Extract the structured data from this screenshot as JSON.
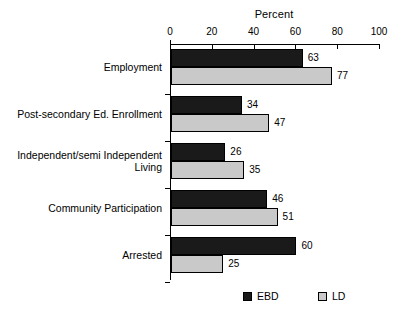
{
  "chart_data": {
    "type": "bar",
    "orientation": "horizontal",
    "title": "Percent",
    "xlabel": "Percent",
    "ylabel": "",
    "xlim": [
      0,
      100
    ],
    "xticks": [
      0,
      20,
      40,
      60,
      80,
      100
    ],
    "xtick_labels": [
      "0",
      "20",
      "40",
      "60",
      "80",
      "100"
    ],
    "grid": false,
    "legend_position": "bottom",
    "categories": [
      "Employment",
      "Post-secondary Ed. Enrollment",
      "Independent/semi Independent\nLiving",
      "Community Participation",
      "Arrested"
    ],
    "series": [
      {
        "name": "EBD",
        "color": "#1a1a1a",
        "values": [
          63,
          34,
          26,
          46,
          60
        ],
        "value_labels": [
          "63",
          "34",
          "26",
          "46",
          "60"
        ]
      },
      {
        "name": "LD",
        "color": "#c9c9c9",
        "values": [
          77,
          47,
          35,
          51,
          25
        ],
        "value_labels": [
          "77",
          "47",
          "35",
          "51",
          "25"
        ]
      }
    ]
  },
  "legend": {
    "items": [
      {
        "label": "EBD",
        "color": "#1a1a1a"
      },
      {
        "label": "LD",
        "color": "#c9c9c9"
      }
    ]
  },
  "colors": {
    "background": "#ffffff",
    "axis": "#000000",
    "text": "#000000",
    "ebd": "#1a1a1a",
    "ld": "#c9c9c9"
  }
}
